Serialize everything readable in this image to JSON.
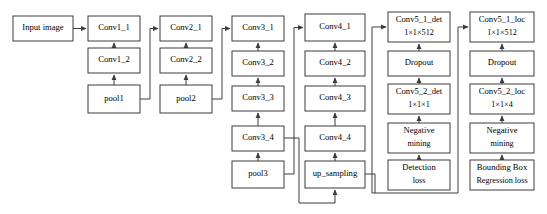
{
  "diagram": {
    "background_color": "#ffffff",
    "box_stroke_color": "#3c3c3c",
    "box_fill_color": "#ffffff",
    "text_color": "#000000",
    "nodes": [
      {
        "id": "input_image",
        "label": "Input image",
        "sublabel": "",
        "x": 13,
        "y": 16,
        "w": 60,
        "h": 25
      },
      {
        "id": "conv1_1",
        "label": "Conv1_1",
        "sublabel": "",
        "x": 88,
        "y": 16,
        "w": 52,
        "h": 25
      },
      {
        "id": "conv1_2",
        "label": "Conv1_2",
        "sublabel": "",
        "x": 88,
        "y": 48,
        "w": 52,
        "h": 25
      },
      {
        "id": "pool1",
        "label": "pool1",
        "sublabel": "",
        "x": 88,
        "y": 85,
        "w": 52,
        "h": 28
      },
      {
        "id": "conv2_1",
        "label": "Conv2_1",
        "sublabel": "",
        "x": 160,
        "y": 16,
        "w": 52,
        "h": 25
      },
      {
        "id": "conv2_2",
        "label": "Conv2_2",
        "sublabel": "",
        "x": 160,
        "y": 48,
        "w": 52,
        "h": 25
      },
      {
        "id": "pool2",
        "label": "pool2",
        "sublabel": "",
        "x": 160,
        "y": 85,
        "w": 52,
        "h": 28
      },
      {
        "id": "conv3_1",
        "label": "Conv3_1",
        "sublabel": "",
        "x": 232,
        "y": 16,
        "w": 52,
        "h": 25
      },
      {
        "id": "conv3_2",
        "label": "Conv3_2",
        "sublabel": "",
        "x": 232,
        "y": 51,
        "w": 52,
        "h": 25
      },
      {
        "id": "conv3_3",
        "label": "Conv3_3",
        "sublabel": "",
        "x": 232,
        "y": 86,
        "w": 52,
        "h": 25
      },
      {
        "id": "conv3_4",
        "label": "Conv3_4",
        "sublabel": "",
        "x": 232,
        "y": 126,
        "w": 52,
        "h": 25
      },
      {
        "id": "pool3",
        "label": "pool3",
        "sublabel": "",
        "x": 232,
        "y": 161,
        "w": 52,
        "h": 27
      },
      {
        "id": "conv4_1",
        "label": "Conv4_1",
        "sublabel": "",
        "x": 305,
        "y": 14,
        "w": 60,
        "h": 27
      },
      {
        "id": "conv4_2",
        "label": "Conv4_2",
        "sublabel": "",
        "x": 305,
        "y": 51,
        "w": 60,
        "h": 25
      },
      {
        "id": "conv4_3",
        "label": "Conv4_3",
        "sublabel": "",
        "x": 305,
        "y": 86,
        "w": 60,
        "h": 25
      },
      {
        "id": "conv4_4",
        "label": "Conv4_4",
        "sublabel": "",
        "x": 305,
        "y": 126,
        "w": 60,
        "h": 25
      },
      {
        "id": "up_sampling",
        "label": "up_sampling",
        "sublabel": "",
        "x": 305,
        "y": 161,
        "w": 60,
        "h": 27
      },
      {
        "id": "conv5_1_det",
        "label": "Conv5_1_det",
        "sublabel": "1×1×512",
        "x": 388,
        "y": 12,
        "w": 62,
        "h": 30
      },
      {
        "id": "dropout_det",
        "label": "Dropout",
        "sublabel": "",
        "x": 388,
        "y": 51,
        "w": 62,
        "h": 25
      },
      {
        "id": "conv5_2_det",
        "label": "Conv5_2_det",
        "sublabel": "1×1×1",
        "x": 388,
        "y": 84,
        "w": 62,
        "h": 30
      },
      {
        "id": "negmine_det",
        "label": "Negative",
        "sublabel": "mining",
        "x": 388,
        "y": 123,
        "w": 62,
        "h": 30
      },
      {
        "id": "det_loss",
        "label": "Detection",
        "sublabel": "loss",
        "x": 388,
        "y": 160,
        "w": 62,
        "h": 30
      },
      {
        "id": "conv5_1_loc",
        "label": "Conv5_1_loc",
        "sublabel": "1×1×512",
        "x": 470,
        "y": 12,
        "w": 64,
        "h": 30
      },
      {
        "id": "dropout_loc",
        "label": "Dropout",
        "sublabel": "",
        "x": 470,
        "y": 51,
        "w": 64,
        "h": 25
      },
      {
        "id": "conv5_2_loc",
        "label": "Conv5_2_loc",
        "sublabel": "1×1×4",
        "x": 470,
        "y": 84,
        "w": 64,
        "h": 30
      },
      {
        "id": "negmine_loc",
        "label": "Negative",
        "sublabel": "mining",
        "x": 470,
        "y": 123,
        "w": 64,
        "h": 30
      },
      {
        "id": "bbox_loss",
        "label": "Bounding Box",
        "sublabel": "Regression loss",
        "x": 470,
        "y": 160,
        "w": 64,
        "h": 30
      }
    ],
    "edges": [
      {
        "id": "input-to-conv1_1",
        "from": "input_image",
        "to": "conv1_1",
        "path": "M 73 28.5 L 86 28.5",
        "arrow": true
      },
      {
        "id": "conv1_2-to-conv1_1",
        "from": "conv1_2",
        "to": "conv1_1",
        "path": "M 114 48 L 114 43",
        "arrow": true
      },
      {
        "id": "pool1-to-conv1_2",
        "from": "pool1",
        "to": "conv1_2",
        "path": "M 114 85 L 114 75",
        "arrow": true
      },
      {
        "id": "pool1-to-conv2_1",
        "from": "pool1",
        "to": "conv2_1",
        "path": "M 140 99 L 150 99 L 150 28.5 L 158 28.5",
        "arrow": true
      },
      {
        "id": "conv2_2-to-conv2_1",
        "from": "conv2_2",
        "to": "conv2_1",
        "path": "M 186 48 L 186 43",
        "arrow": true
      },
      {
        "id": "pool2-to-conv2_2",
        "from": "pool2",
        "to": "conv2_2",
        "path": "M 186 85 L 186 75",
        "arrow": true
      },
      {
        "id": "pool2-to-conv3_1",
        "from": "pool2",
        "to": "conv3_1",
        "path": "M 212 99 L 222 99 L 222 28.5 L 230 28.5",
        "arrow": true
      },
      {
        "id": "conv3_2-to-conv3_1",
        "from": "conv3_2",
        "to": "conv3_1",
        "path": "M 258 51 L 258 43",
        "arrow": true
      },
      {
        "id": "conv3_3-to-conv3_2",
        "from": "conv3_3",
        "to": "conv3_2",
        "path": "M 258 86 L 258 78",
        "arrow": true
      },
      {
        "id": "conv3_4-to-conv3_3",
        "from": "conv3_4",
        "to": "conv3_3",
        "path": "M 258 126 L 258 113",
        "arrow": true
      },
      {
        "id": "pool3-to-conv3_4",
        "from": "pool3",
        "to": "conv3_4",
        "path": "M 258 161 L 258 153",
        "arrow": true
      },
      {
        "id": "pool3-to-conv4_1",
        "from": "pool3",
        "to": "conv4_1",
        "path": "M 284 174 L 294 174 L 294 27.5 L 303 27.5",
        "arrow": true
      },
      {
        "id": "conv3_4-to-upsampling",
        "from": "conv3_4",
        "to": "up_sampling",
        "path": "M 284 138 L 299 138 L 299 203 L 335 203 L 335 190",
        "arrow": true
      },
      {
        "id": "conv4_2-to-conv4_1",
        "from": "conv4_2",
        "to": "conv4_1",
        "path": "M 335 51 L 335 43",
        "arrow": true
      },
      {
        "id": "conv4_3-to-conv4_2",
        "from": "conv4_3",
        "to": "conv4_2",
        "path": "M 335 86 L 335 78",
        "arrow": true
      },
      {
        "id": "conv4_4-to-conv4_3",
        "from": "conv4_4",
        "to": "conv4_3",
        "path": "M 335 126 L 335 113",
        "arrow": true
      },
      {
        "id": "upsampling-to-conv4_4",
        "from": "up_sampling",
        "to": "conv4_4",
        "path": "M 335 161 L 335 153",
        "arrow": true
      },
      {
        "id": "upsampling-to-det",
        "from": "up_sampling",
        "to": "conv5_1_det",
        "path": "M 365 174 L 375 174 L 375 193 L 372 193 L 372 27 L 386 27",
        "arrow": true
      },
      {
        "id": "upsampling-to-loc",
        "from": "up_sampling",
        "to": "conv5_1_loc",
        "path": "M 375 193 L 458 193 L 458 27 L 468 27",
        "arrow": true
      },
      {
        "id": "dropout-to-conv5_1_det",
        "from": "dropout_det",
        "to": "conv5_1_det",
        "path": "M 419 51 L 419 44",
        "arrow": true
      },
      {
        "id": "conv5_2-to-dropout-det",
        "from": "conv5_2_det",
        "to": "dropout_det",
        "path": "M 419 84 L 419 78",
        "arrow": true
      },
      {
        "id": "negmine-to-conv5_2-det",
        "from": "negmine_det",
        "to": "conv5_2_det",
        "path": "M 419 123 L 419 116",
        "arrow": true
      },
      {
        "id": "detloss-to-negmine",
        "from": "det_loss",
        "to": "negmine_det",
        "path": "M 419 160 L 419 155",
        "arrow": true
      },
      {
        "id": "dropout-to-conv5_1_loc",
        "from": "dropout_loc",
        "to": "conv5_1_loc",
        "path": "M 502 51 L 502 44",
        "arrow": true
      },
      {
        "id": "conv5_2-to-dropout-loc",
        "from": "conv5_2_loc",
        "to": "dropout_loc",
        "path": "M 502 84 L 502 78",
        "arrow": true
      },
      {
        "id": "negmine-to-conv5_2-loc",
        "from": "negmine_loc",
        "to": "conv5_2_loc",
        "path": "M 502 123 L 502 116",
        "arrow": true
      },
      {
        "id": "bboxloss-to-negmine",
        "from": "bbox_loss",
        "to": "negmine_loc",
        "path": "M 502 160 L 502 155",
        "arrow": true
      }
    ]
  }
}
